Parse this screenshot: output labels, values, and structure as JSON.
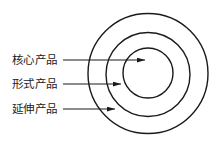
{
  "diagram": {
    "type": "concentric-circles",
    "colors": {
      "stroke": "#1a1a1a",
      "text": "#222222",
      "background": "#ffffff"
    },
    "circles": [
      {
        "name": "outer",
        "cx": 148,
        "cy": 73.5,
        "r": 60
      },
      {
        "name": "middle",
        "cx": 148,
        "cy": 74.5,
        "r": 42
      },
      {
        "name": "inner",
        "cx": 148,
        "cy": 73,
        "r": 25
      }
    ],
    "labels": [
      {
        "text": "核心产品",
        "y": 60,
        "arrow_x1": 63,
        "arrow_x2": 145
      },
      {
        "text": "形式产品",
        "y": 84,
        "arrow_x1": 63,
        "arrow_x2": 121
      },
      {
        "text": "延伸产品",
        "y": 109,
        "arrow_x1": 63,
        "arrow_x2": 115
      }
    ]
  }
}
